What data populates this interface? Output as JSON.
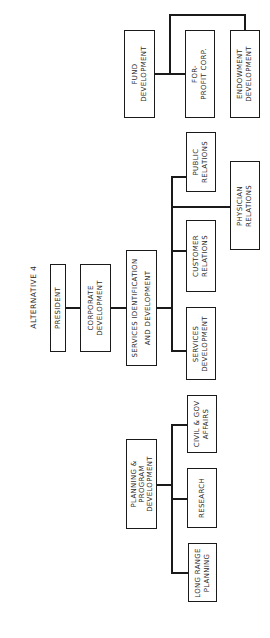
{
  "title": "ALTERNATIVE 4",
  "nodes": {
    "president": "PRESIDENT",
    "corporate_development": "CORPORATE\nDEVELOPMENT",
    "services_identification": "SERVICES IDENTIFICATION\nAND DEVELOPMENT",
    "planning_program": "PLANNING &\nPROGRAM\nDEVELOPMENT",
    "fund_development": "FUND\nDEVELOPMENT",
    "for_profit_corp": "FOR-\nPROFIT CORP.",
    "endowment_development": "ENDOWMENT\nDEVELOPMENT",
    "public_relations": "PUBLIC\nRELATIONS",
    "physician_relations": "PHYSICIAN\nRELATIONS",
    "customer_relations": "CUSTOMER\nRELATIONS",
    "services_development": "SERVICES\nDEVELOPMENT",
    "civil_gov_affairs": "CIVIL & GOV\nAFFAIRS",
    "research": "RESEARCH",
    "long_range_planning": "LONG RANGE\nPLANNING"
  },
  "colors": {
    "line": "#1a1a1a",
    "text": "#2a2a2a",
    "background": "#ffffff"
  }
}
